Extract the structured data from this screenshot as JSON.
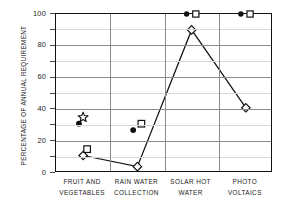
{
  "chart_data": {
    "type": "line",
    "title": "",
    "xlabel": "",
    "ylabel": "PERCENTAGE OF ANNUAL REQUIREMENT",
    "ylim": [
      0,
      100
    ],
    "yticks": [
      0,
      20,
      40,
      60,
      80,
      100
    ],
    "grid": "horizontal minor every 10, major every 20; vertical separators between categories",
    "legend": "none",
    "categories": [
      "FRUIT AND VEGETABLES",
      "RAIN WATER COLLECTION",
      "SOLAR HOT WATER",
      "PHOTO VOLTAICS"
    ],
    "category_lines": [
      [
        "FRUIT AND",
        "VEGETABLES"
      ],
      [
        "RAIN WATER",
        "COLLECTION"
      ],
      [
        "SOLAR HOT",
        "WATER"
      ],
      [
        "PHOTO",
        "VOLTAICS"
      ]
    ],
    "series": [
      {
        "name": "open-diamond-line",
        "marker": "open-diamond",
        "connected": true,
        "values": [
          11,
          4,
          90,
          41
        ]
      },
      {
        "name": "filled-circle",
        "marker": "filled-circle",
        "connected": false,
        "values": [
          31,
          27,
          100,
          100
        ]
      },
      {
        "name": "open-square",
        "marker": "open-square",
        "connected": false,
        "values": [
          15,
          31,
          100,
          100
        ]
      },
      {
        "name": "open-star",
        "marker": "open-star",
        "connected": false,
        "values": [
          35,
          null,
          null,
          null
        ]
      }
    ]
  },
  "axis": {
    "y_title": "PERCENTAGE OF ANNUAL REQUIREMENT",
    "y_tick_labels": [
      "100",
      "80",
      "60",
      "40",
      "20",
      "0"
    ]
  },
  "colors": {
    "line": "#111111",
    "marker_fill": "#111111",
    "marker_open": "#ffffff",
    "grid_minor": "#d9d9d9",
    "grid_major": "#8a8a8a",
    "frame": "#111111",
    "text": "#1a1a1a",
    "background": "#ffffff"
  }
}
